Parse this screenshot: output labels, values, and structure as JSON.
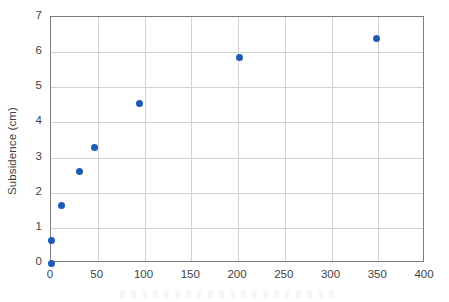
{
  "chart_data": {
    "type": "scatter",
    "title": "",
    "xlabel": "",
    "ylabel": "Subsidence (cm)",
    "xlim": [
      0,
      400
    ],
    "ylim": [
      0,
      7
    ],
    "grid": true,
    "legend": "none",
    "marker_color": "#1f5bb5",
    "x_ticks": [
      "0",
      "50",
      "100",
      "150",
      "200",
      "250",
      "300",
      "350",
      "400"
    ],
    "x_tick_values": [
      0,
      50,
      100,
      150,
      200,
      250,
      300,
      350,
      400
    ],
    "y_ticks": [
      "0",
      "1",
      "2",
      "3",
      "4",
      "5",
      "6",
      "7"
    ],
    "y_tick_values": [
      0,
      1,
      2,
      3,
      4,
      5,
      6,
      7
    ],
    "points": [
      {
        "x": 0,
        "y": 0.0
      },
      {
        "x": 0,
        "y": 0.65
      },
      {
        "x": 11,
        "y": 1.63
      },
      {
        "x": 30,
        "y": 2.6
      },
      {
        "x": 47,
        "y": 3.28
      },
      {
        "x": 95,
        "y": 4.55
      },
      {
        "x": 202,
        "y": 5.85
      },
      {
        "x": 348,
        "y": 6.38
      }
    ]
  },
  "colors": {
    "marker": "#1f5bb5",
    "gridline": "#d2d2d2",
    "frame": "#7d7d7d",
    "text": "#3f3f3f",
    "background": "#ffffff"
  }
}
